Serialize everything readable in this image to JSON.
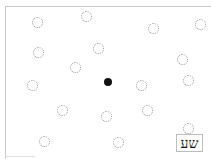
{
  "canvas": {
    "label_text": "שע",
    "circle_count": 17,
    "center_dot": "black-dot",
    "colors": {
      "circle_stroke": "#9a9a9a",
      "dot_fill": "#111111",
      "frame": "#c8c8c8"
    }
  }
}
